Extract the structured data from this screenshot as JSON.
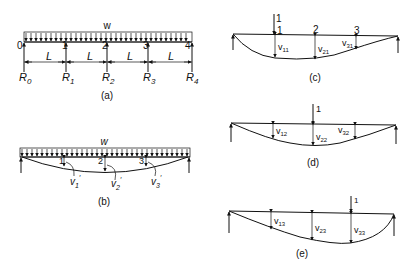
{
  "figure_a": {
    "load_label": "w",
    "node_labels": [
      "0",
      "1",
      "2",
      "3",
      "4"
    ],
    "span_labels": [
      "L",
      "L",
      "L",
      "L"
    ],
    "reaction_labels": [
      {
        "base": "R",
        "sub": "0"
      },
      {
        "base": "R",
        "sub": "1"
      },
      {
        "base": "R",
        "sub": "2"
      },
      {
        "base": "R",
        "sub": "3"
      },
      {
        "base": "R",
        "sub": "4"
      }
    ],
    "caption": "(a)"
  },
  "figure_b": {
    "load_label": "w",
    "node_labels": [
      "1",
      "2",
      "3"
    ],
    "deflection_labels": [
      {
        "base": "v",
        "sub": "1",
        "sup": "′"
      },
      {
        "base": "v",
        "sub": "2",
        "sup": "′"
      },
      {
        "base": "v",
        "sub": "3",
        "sup": "′"
      }
    ],
    "caption": "(b)"
  },
  "figure_c": {
    "load_label": "1",
    "node_labels": [
      "1",
      "2",
      "3"
    ],
    "deflection_labels": [
      {
        "base": "v",
        "sub": "11"
      },
      {
        "base": "v",
        "sub": "21"
      },
      {
        "base": "v",
        "sub": "31"
      }
    ],
    "caption": "(c)"
  },
  "figure_d": {
    "load_label": "1",
    "deflection_labels": [
      {
        "base": "v",
        "sub": "12"
      },
      {
        "base": "v",
        "sub": "22"
      },
      {
        "base": "v",
        "sub": "32"
      }
    ],
    "caption": "(d)"
  },
  "figure_e": {
    "load_label": "1",
    "deflection_labels": [
      {
        "base": "v",
        "sub": "13"
      },
      {
        "base": "v",
        "sub": "23"
      },
      {
        "base": "v",
        "sub": "33"
      }
    ],
    "caption": "(e)"
  }
}
